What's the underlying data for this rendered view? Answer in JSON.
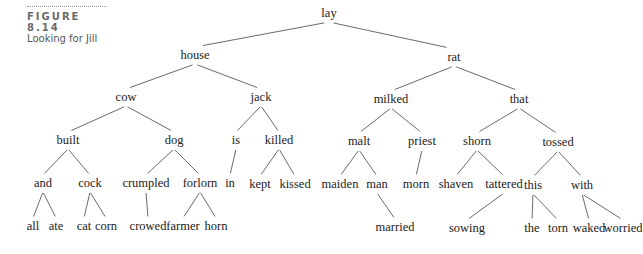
{
  "caption": {
    "figure_label": "FIGURE 8.14",
    "title": "Looking for Jill"
  },
  "tree": {
    "nodes": [
      {
        "id": "lay",
        "label": "lay",
        "x": 329,
        "y": 17
      },
      {
        "id": "house",
        "label": "house",
        "x": 195,
        "y": 59
      },
      {
        "id": "rat",
        "label": "rat",
        "x": 454,
        "y": 61
      },
      {
        "id": "cow",
        "label": "cow",
        "x": 126,
        "y": 101
      },
      {
        "id": "jack",
        "label": "jack",
        "x": 261,
        "y": 101
      },
      {
        "id": "milked",
        "label": "milked",
        "x": 391,
        "y": 103
      },
      {
        "id": "that",
        "label": "that",
        "x": 519,
        "y": 103
      },
      {
        "id": "built",
        "label": "built",
        "x": 68,
        "y": 144
      },
      {
        "id": "dog",
        "label": "dog",
        "x": 174,
        "y": 144
      },
      {
        "id": "is",
        "label": "is",
        "x": 236,
        "y": 144
      },
      {
        "id": "killed",
        "label": "killed",
        "x": 279,
        "y": 144
      },
      {
        "id": "malt",
        "label": "malt",
        "x": 359,
        "y": 145
      },
      {
        "id": "priest",
        "label": "priest",
        "x": 422,
        "y": 145
      },
      {
        "id": "shorn",
        "label": "shorn",
        "x": 477,
        "y": 145
      },
      {
        "id": "tossed",
        "label": "tossed",
        "x": 558,
        "y": 146
      },
      {
        "id": "and",
        "label": "and",
        "x": 43,
        "y": 187
      },
      {
        "id": "cock",
        "label": "cock",
        "x": 90,
        "y": 187
      },
      {
        "id": "crumpled",
        "label": "crumpled",
        "x": 146,
        "y": 187
      },
      {
        "id": "forlorn",
        "label": "forlorn",
        "x": 200,
        "y": 187
      },
      {
        "id": "in",
        "label": "in",
        "x": 230,
        "y": 187
      },
      {
        "id": "kept",
        "label": "kept",
        "x": 260,
        "y": 188
      },
      {
        "id": "kissed",
        "label": "kissed",
        "x": 295,
        "y": 188
      },
      {
        "id": "maiden",
        "label": "maiden",
        "x": 340,
        "y": 188
      },
      {
        "id": "man",
        "label": "man",
        "x": 377,
        "y": 188
      },
      {
        "id": "morn",
        "label": "morn",
        "x": 416,
        "y": 188
      },
      {
        "id": "shaven",
        "label": "shaven",
        "x": 456,
        "y": 188
      },
      {
        "id": "tattered",
        "label": "tattered",
        "x": 504,
        "y": 188
      },
      {
        "id": "this",
        "label": "this",
        "x": 533,
        "y": 189
      },
      {
        "id": "with",
        "label": "with",
        "x": 582,
        "y": 189
      },
      {
        "id": "all",
        "label": "all",
        "x": 33,
        "y": 230
      },
      {
        "id": "ate",
        "label": "ate",
        "x": 56,
        "y": 230
      },
      {
        "id": "cat",
        "label": "cat",
        "x": 84,
        "y": 230
      },
      {
        "id": "corn",
        "label": "corn",
        "x": 106,
        "y": 230
      },
      {
        "id": "crowed",
        "label": "crowed",
        "x": 148,
        "y": 230
      },
      {
        "id": "farmer",
        "label": "farmer",
        "x": 183,
        "y": 230
      },
      {
        "id": "horn",
        "label": "horn",
        "x": 216,
        "y": 230
      },
      {
        "id": "married",
        "label": "married",
        "x": 395,
        "y": 231
      },
      {
        "id": "sowing",
        "label": "sowing",
        "x": 467,
        "y": 232
      },
      {
        "id": "the",
        "label": "the",
        "x": 532,
        "y": 232
      },
      {
        "id": "torn",
        "label": "torn",
        "x": 558,
        "y": 232
      },
      {
        "id": "waked",
        "label": "waked",
        "x": 589,
        "y": 232
      },
      {
        "id": "worried",
        "label": "worried",
        "x": 623,
        "y": 232
      }
    ],
    "edges": [
      [
        "lay",
        "house"
      ],
      [
        "lay",
        "rat"
      ],
      [
        "house",
        "cow"
      ],
      [
        "house",
        "jack"
      ],
      [
        "rat",
        "milked"
      ],
      [
        "rat",
        "that"
      ],
      [
        "cow",
        "built"
      ],
      [
        "cow",
        "dog"
      ],
      [
        "jack",
        "is"
      ],
      [
        "jack",
        "killed"
      ],
      [
        "milked",
        "malt"
      ],
      [
        "milked",
        "priest"
      ],
      [
        "that",
        "shorn"
      ],
      [
        "that",
        "tossed"
      ],
      [
        "built",
        "and"
      ],
      [
        "built",
        "cock"
      ],
      [
        "dog",
        "crumpled"
      ],
      [
        "dog",
        "forlorn"
      ],
      [
        "is",
        "in"
      ],
      [
        "killed",
        "kept"
      ],
      [
        "killed",
        "kissed"
      ],
      [
        "malt",
        "maiden"
      ],
      [
        "malt",
        "man"
      ],
      [
        "priest",
        "morn"
      ],
      [
        "shorn",
        "shaven"
      ],
      [
        "shorn",
        "tattered"
      ],
      [
        "tossed",
        "this"
      ],
      [
        "tossed",
        "with"
      ],
      [
        "and",
        "all"
      ],
      [
        "and",
        "ate"
      ],
      [
        "cock",
        "cat"
      ],
      [
        "cock",
        "corn"
      ],
      [
        "crumpled",
        "crowed"
      ],
      [
        "forlorn",
        "farmer"
      ],
      [
        "forlorn",
        "horn"
      ],
      [
        "man",
        "married"
      ],
      [
        "tattered",
        "sowing"
      ],
      [
        "this",
        "the"
      ],
      [
        "this",
        "torn"
      ],
      [
        "with",
        "waked"
      ],
      [
        "with",
        "worried"
      ]
    ]
  }
}
